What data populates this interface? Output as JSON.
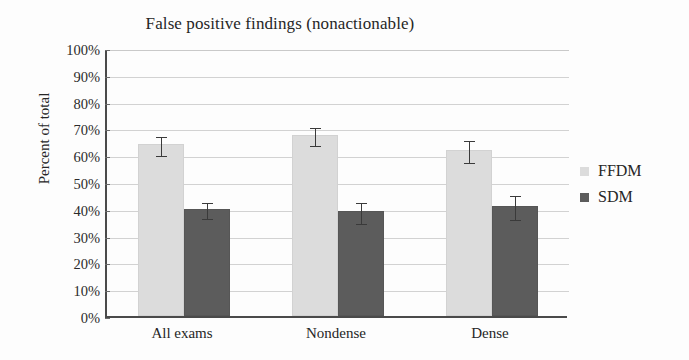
{
  "chart_data": {
    "type": "bar",
    "title": "False positive findings (nonactionable)",
    "xlabel": "",
    "ylabel": "Percent of total",
    "categories": [
      "All exams",
      "Nondense",
      "Dense"
    ],
    "ylim": [
      0,
      100
    ],
    "ytick_labels": [
      "0%",
      "10%",
      "20%",
      "30%",
      "40%",
      "50%",
      "60%",
      "70%",
      "80%",
      "90%",
      "100%"
    ],
    "ytick_values": [
      0,
      10,
      20,
      30,
      40,
      50,
      60,
      70,
      80,
      90,
      100
    ],
    "grid": true,
    "grid_axis": "y",
    "legend_position": "right",
    "series": [
      {
        "name": "FFDM",
        "color": "#dcdcdc",
        "values": [
          64,
          67.5,
          62
        ],
        "errors": [
          3.5,
          3.5,
          4.0
        ]
      },
      {
        "name": "SDM",
        "color": "#5c5c5c",
        "values": [
          40,
          39,
          41
        ],
        "errors": [
          3.0,
          4.0,
          4.5
        ]
      }
    ]
  },
  "legend": {
    "items": [
      {
        "label": "FFDM",
        "color": "#dcdcdc"
      },
      {
        "label": "SDM",
        "color": "#5c5c5c"
      }
    ]
  },
  "colors": {
    "ffdm": "#dcdcdc",
    "sdm": "#5c5c5c",
    "axis": "#4a4a4a",
    "grid": "#d2d2d2",
    "text": "#262626",
    "background": "#fdfdfd"
  }
}
